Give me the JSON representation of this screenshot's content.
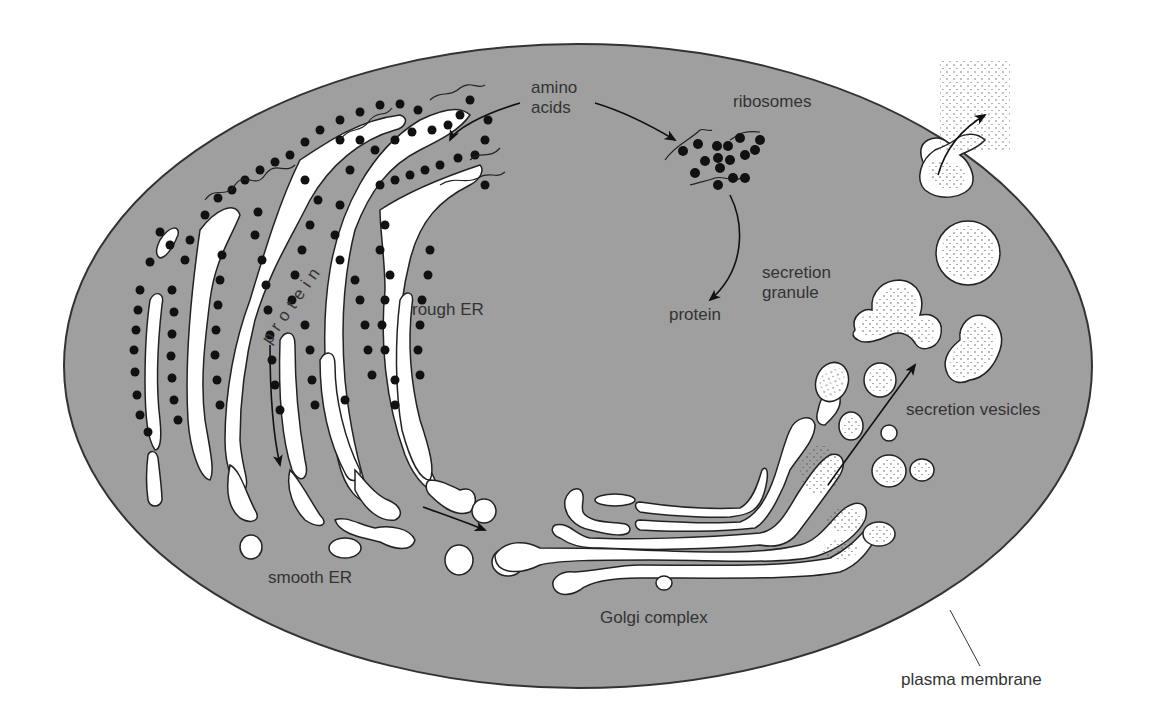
{
  "diagram": {
    "type": "biological cell schematic - protein secretion pathway",
    "colors": {
      "cytoplasm": "#9f9f9f",
      "membrane": "#333333",
      "organelle": "#ffffff",
      "ribosome": "#111111",
      "text": "#333333",
      "background": "#ffffff"
    }
  },
  "labels": {
    "amino_acids_line1": "amino",
    "amino_acids_line2": "acids",
    "ribosomes": "ribosomes",
    "protein_free": "protein",
    "protein_in_er": "protein",
    "rough_er": "rough ER",
    "smooth_er": "smooth ER",
    "golgi_complex": "Golgi complex",
    "secretion_granule_line1": "secretion",
    "secretion_granule_line2": "granule",
    "secretion_vesicles": "secretion vesicles",
    "plasma_membrane": "plasma membrane"
  },
  "flow": [
    {
      "from": "amino acids",
      "to": "rough ER"
    },
    {
      "from": "amino acids",
      "to": "ribosomes"
    },
    {
      "from": "ribosomes",
      "to": "protein"
    },
    {
      "from": "rough ER",
      "to": "smooth ER"
    },
    {
      "from": "smooth ER",
      "to": "Golgi complex"
    },
    {
      "from": "Golgi complex",
      "to": "secretion granule"
    },
    {
      "from": "secretion granule",
      "to": "exterior (exocytosis)"
    }
  ]
}
